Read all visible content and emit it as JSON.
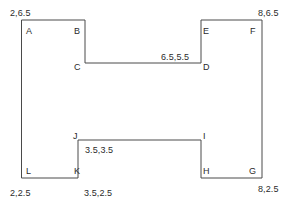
{
  "diagram": {
    "type": "polygon-outline",
    "stroke_color": "#4a4a4a",
    "stroke_width": 1,
    "background_color": "#ffffff",
    "vertex_labels": [
      {
        "id": "A",
        "text": "A",
        "x": 26,
        "y": 26
      },
      {
        "id": "B",
        "text": "B",
        "x": 74,
        "y": 26
      },
      {
        "id": "C",
        "text": "C",
        "x": 74,
        "y": 62
      },
      {
        "id": "D",
        "text": "D",
        "x": 203,
        "y": 62
      },
      {
        "id": "E",
        "text": "E",
        "x": 203,
        "y": 26
      },
      {
        "id": "F",
        "text": "F",
        "x": 250,
        "y": 26
      },
      {
        "id": "G",
        "text": "G",
        "x": 249,
        "y": 166
      },
      {
        "id": "H",
        "text": "H",
        "x": 203,
        "y": 166
      },
      {
        "id": "I",
        "text": "I",
        "x": 203,
        "y": 131
      },
      {
        "id": "J",
        "text": "J",
        "x": 73,
        "y": 131
      },
      {
        "id": "K",
        "text": "K",
        "x": 74,
        "y": 166
      },
      {
        "id": "L",
        "text": "L",
        "x": 26,
        "y": 166
      }
    ],
    "coordinate_labels": [
      {
        "id": "coord-a",
        "text": "2,6.5",
        "x": 10,
        "y": 8
      },
      {
        "id": "coord-f",
        "text": "8,6.5",
        "x": 258,
        "y": 8
      },
      {
        "id": "coord-d",
        "text": "6.5,5.5",
        "x": 161,
        "y": 52
      },
      {
        "id": "coord-j",
        "text": "3.5,3.5",
        "x": 85,
        "y": 145
      },
      {
        "id": "coord-l",
        "text": "2,2.5",
        "x": 10,
        "y": 188
      },
      {
        "id": "coord-k",
        "text": "3.5,2.5",
        "x": 84,
        "y": 188
      },
      {
        "id": "coord-g",
        "text": "8,2.5",
        "x": 258,
        "y": 184
      }
    ],
    "outline_path": "M 22,20 L 85,20 L 85,63 L 201,63 L 201,20 L 262,20 L 262,178 L 201,178 L 201,140 L 78,140 L 78,178 L 22,178 Z",
    "outline_points": [
      {
        "label": "A",
        "px": 22,
        "py": 20
      },
      {
        "label": "B",
        "px": 85,
        "py": 20
      },
      {
        "label": "C",
        "px": 85,
        "py": 63
      },
      {
        "label": "D",
        "px": 201,
        "py": 63
      },
      {
        "label": "E",
        "px": 201,
        "py": 20
      },
      {
        "label": "F",
        "px": 262,
        "py": 20
      },
      {
        "label": "G",
        "px": 262,
        "py": 178
      },
      {
        "label": "H",
        "px": 201,
        "py": 178
      },
      {
        "label": "I",
        "px": 201,
        "py": 140
      },
      {
        "label": "J",
        "px": 78,
        "py": 140
      },
      {
        "label": "K",
        "px": 78,
        "py": 178
      },
      {
        "label": "L",
        "px": 22,
        "py": 178
      }
    ]
  }
}
